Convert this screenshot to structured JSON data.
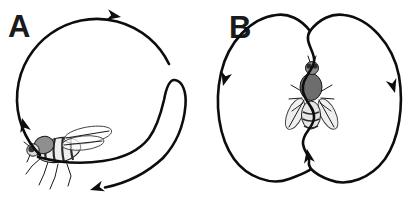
{
  "figure": {
    "background_color": "#ffffff",
    "ink_color": "#0d0d0d",
    "panels": [
      {
        "label": "A",
        "icon": "fly-side-view-icon",
        "path_shape": "circular-loop-clockwise-with-inward-hook",
        "arrow_directions": [
          "up-left-side",
          "right-at-top",
          "left-at-bottom"
        ]
      },
      {
        "label": "B",
        "icon": "fly-top-view-icon",
        "path_shape": "two-lobes-joined-by-wavy-center-line",
        "arrow_directions": [
          "down-left-outer-edge",
          "down-right-outer-edge",
          "up-center-line"
        ]
      }
    ]
  }
}
